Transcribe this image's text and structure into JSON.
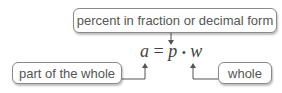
{
  "diagram": {
    "labels": {
      "top": "percent in fraction or decimal form",
      "left": "part of the whole",
      "right": "whole"
    },
    "equation": {
      "a": "a",
      "equals": "=",
      "p": "p",
      "dot": "•",
      "w": "w"
    },
    "colors": {
      "line": "#555555",
      "box_border": "#8a8a8a",
      "text": "#555555"
    }
  }
}
